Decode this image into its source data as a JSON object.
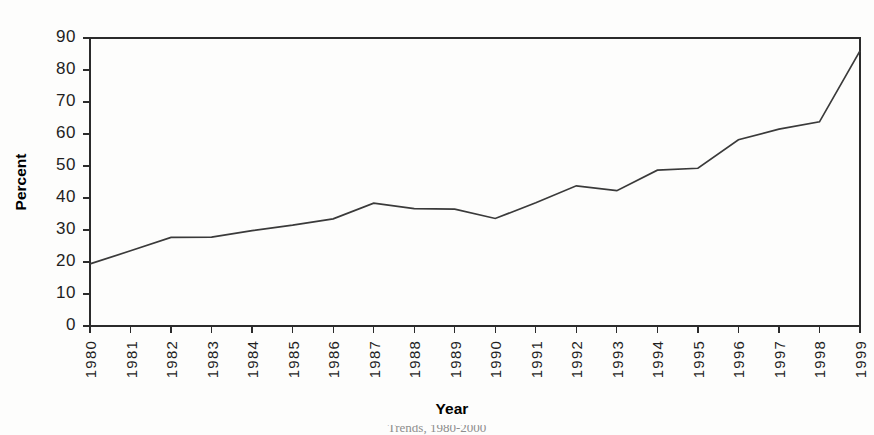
{
  "figure": {
    "background_color": "#fdfdfc",
    "line_color": "#3a3a3a",
    "axis_color": "#2b2b2b",
    "caption_partial": "Trends, 1980-2000"
  },
  "chart_data": {
    "type": "line",
    "title": "",
    "xlabel": "Year",
    "ylabel": "Percent",
    "categories": [
      "1980",
      "1981",
      "1982",
      "1983",
      "1984",
      "1985",
      "1986",
      "1987",
      "1988",
      "1989",
      "1990",
      "1991",
      "1992",
      "1993",
      "1994",
      "1995",
      "1996",
      "1997",
      "1998",
      "1999"
    ],
    "values": [
      19.4,
      23.5,
      27.7,
      27.8,
      29.8,
      31.5,
      33.5,
      38.4,
      36.7,
      36.5,
      33.6,
      38.5,
      43.8,
      42.3,
      48.7,
      49.3,
      58.2,
      61.5,
      63.8,
      86.0
    ],
    "ylim": [
      0,
      90
    ],
    "ytick_step": 10,
    "ytick_labels": [
      "0",
      "10",
      "20",
      "30",
      "40",
      "50",
      "60",
      "70",
      "80",
      "90"
    ],
    "grid": false,
    "legend": "none",
    "markers": "none",
    "series": [
      {
        "name": "Percent",
        "values": [
          19.4,
          23.5,
          27.7,
          27.8,
          29.8,
          31.5,
          33.5,
          38.4,
          36.7,
          36.5,
          33.6,
          38.5,
          43.8,
          42.3,
          48.7,
          49.3,
          58.2,
          61.5,
          63.8,
          86.0
        ]
      }
    ]
  }
}
